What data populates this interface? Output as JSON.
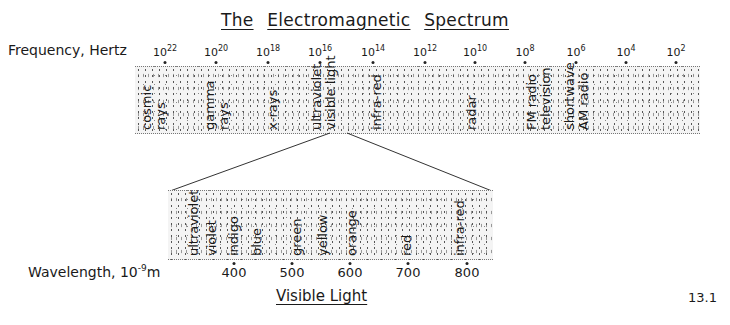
{
  "title": {
    "words": [
      "The",
      "Electromagnetic",
      "Spectrum"
    ]
  },
  "frequency_axis": {
    "label": "Frequency, Hertz",
    "ticks": [
      {
        "base": "10",
        "exp": "22",
        "x": 165
      },
      {
        "base": "10",
        "exp": "20",
        "x": 216
      },
      {
        "base": "10",
        "exp": "18",
        "x": 268
      },
      {
        "base": "10",
        "exp": "16",
        "x": 320
      },
      {
        "base": "10",
        "exp": "14",
        "x": 373
      },
      {
        "base": "10",
        "exp": "12",
        "x": 425
      },
      {
        "base": "10",
        "exp": "10",
        "x": 475
      },
      {
        "base": "10",
        "exp": "8",
        "x": 525
      },
      {
        "base": "10",
        "exp": "6",
        "x": 576
      },
      {
        "base": "10",
        "exp": "4",
        "x": 626
      },
      {
        "base": "10",
        "exp": "2",
        "x": 676
      }
    ]
  },
  "spectrum_band": {
    "regions": [
      {
        "lines": [
          "cosmic",
          "rays"
        ],
        "x": 140
      },
      {
        "lines": [
          "gamma",
          "rays"
        ],
        "x": 203
      },
      {
        "lines": [
          "x-rays"
        ],
        "x": 266
      },
      {
        "lines": [
          "ultraviolet",
          "visible light"
        ],
        "x": 310
      },
      {
        "lines": [
          "infra-red"
        ],
        "x": 370
      },
      {
        "lines": [
          "radar"
        ],
        "x": 465
      },
      {
        "lines": [
          "FM radio",
          "television"
        ],
        "x": 525
      },
      {
        "lines": [
          "shortwave",
          "AM radio"
        ],
        "x": 563
      }
    ]
  },
  "visible_band": {
    "regions": [
      {
        "lines": [
          "ultraviolet"
        ],
        "x": 187
      },
      {
        "lines": [
          "violet"
        ],
        "x": 205
      },
      {
        "lines": [
          "indigo"
        ],
        "x": 227
      },
      {
        "lines": [
          "blue"
        ],
        "x": 250
      },
      {
        "lines": [
          "green"
        ],
        "x": 290
      },
      {
        "lines": [
          "yellow"
        ],
        "x": 316
      },
      {
        "lines": [
          "orange"
        ],
        "x": 345
      },
      {
        "lines": [
          "red"
        ],
        "x": 400
      },
      {
        "lines": [
          "infra-red"
        ],
        "x": 453
      }
    ]
  },
  "wavelength_axis": {
    "label_prefix": "Wavelength, 10",
    "label_exp": "-9",
    "label_unit": "m",
    "ticks": [
      {
        "label": "400",
        "x": 234
      },
      {
        "label": "500",
        "x": 292
      },
      {
        "label": "600",
        "x": 350
      },
      {
        "label": "700",
        "x": 408
      },
      {
        "label": "800",
        "x": 467
      }
    ]
  },
  "subtitle": "Visible Light",
  "figure_number": "13.1"
}
